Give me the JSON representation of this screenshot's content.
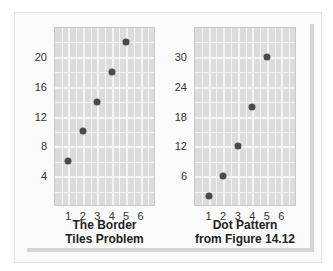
{
  "chart_data": [
    {
      "type": "scatter",
      "title": "The Border Tiles Problem",
      "title_lines": [
        "The Border",
        "Tiles Problem"
      ],
      "xlabel": "",
      "ylabel": "",
      "x": [
        1,
        2,
        3,
        4,
        5
      ],
      "y": [
        6,
        10,
        14,
        18,
        22
      ],
      "xlim": [
        0,
        7
      ],
      "ylim": [
        0,
        24
      ],
      "xticks": [
        1,
        2,
        3,
        4,
        5,
        6
      ],
      "yticks": [
        4,
        8,
        12,
        16,
        20
      ],
      "grid": true,
      "legend": null
    },
    {
      "type": "scatter",
      "title": "Dot Pattern from Figure 14.12",
      "title_lines": [
        "Dot Pattern",
        "from Figure 14.12"
      ],
      "xlabel": "",
      "ylabel": "",
      "x": [
        1,
        2,
        3,
        4,
        5
      ],
      "y": [
        2,
        6,
        12,
        20,
        30
      ],
      "xlim": [
        0,
        7
      ],
      "ylim": [
        0,
        36
      ],
      "xticks": [
        1,
        2,
        3,
        4,
        5,
        6
      ],
      "yticks": [
        6,
        12,
        18,
        24,
        30
      ],
      "grid": true,
      "legend": null
    }
  ],
  "colors": {
    "plot_bg": "#dcdcdc",
    "grid": "#f4f4f4",
    "dot": "#4a4a4a",
    "frame_shadow": "#d6d6d6"
  }
}
